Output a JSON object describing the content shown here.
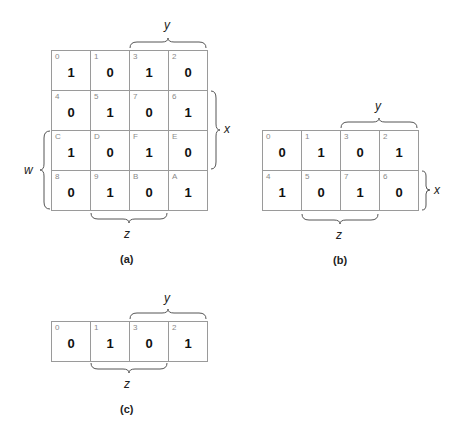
{
  "maps": {
    "a": {
      "caption": "(a)",
      "cells": [
        {
          "index": "0",
          "value": "1"
        },
        {
          "index": "1",
          "value": "0"
        },
        {
          "index": "3",
          "value": "1"
        },
        {
          "index": "2",
          "value": "0"
        },
        {
          "index": "4",
          "value": "0"
        },
        {
          "index": "5",
          "value": "1"
        },
        {
          "index": "7",
          "value": "0"
        },
        {
          "index": "6",
          "value": "1"
        },
        {
          "index": "C",
          "value": "1"
        },
        {
          "index": "D",
          "value": "0"
        },
        {
          "index": "F",
          "value": "1"
        },
        {
          "index": "E",
          "value": "0"
        },
        {
          "index": "8",
          "value": "0"
        },
        {
          "index": "9",
          "value": "1"
        },
        {
          "index": "B",
          "value": "0"
        },
        {
          "index": "A",
          "value": "1"
        }
      ],
      "labels": {
        "y": "y",
        "x": "x",
        "w": "w",
        "z": "z"
      }
    },
    "b": {
      "caption": "(b)",
      "cells": [
        {
          "index": "0",
          "value": "0"
        },
        {
          "index": "1",
          "value": "1"
        },
        {
          "index": "3",
          "value": "0"
        },
        {
          "index": "2",
          "value": "1"
        },
        {
          "index": "4",
          "value": "1"
        },
        {
          "index": "5",
          "value": "0"
        },
        {
          "index": "7",
          "value": "1"
        },
        {
          "index": "6",
          "value": "0"
        }
      ],
      "labels": {
        "y": "y",
        "x": "x",
        "z": "z"
      }
    },
    "c": {
      "caption": "(c)",
      "cells": [
        {
          "index": "0",
          "value": "0"
        },
        {
          "index": "1",
          "value": "1"
        },
        {
          "index": "3",
          "value": "0"
        },
        {
          "index": "2",
          "value": "1"
        }
      ],
      "labels": {
        "y": "y",
        "z": "z"
      }
    }
  }
}
